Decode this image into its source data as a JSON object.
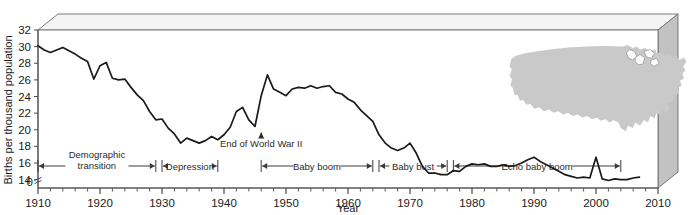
{
  "chart_data": {
    "type": "line",
    "title": "",
    "xlabel": "Year",
    "ylabel": "Births per thousand population",
    "xlim": [
      1910,
      2010
    ],
    "ylim": [
      13,
      32
    ],
    "xticks": [
      1910,
      1920,
      1930,
      1940,
      1950,
      1960,
      1970,
      1980,
      1990,
      2000,
      2010
    ],
    "yticks": [
      14,
      16,
      18,
      20,
      22,
      24,
      26,
      28,
      30,
      32
    ],
    "y_axis_break_label": "0",
    "grid": false,
    "legend": false,
    "minor_tick_interval": 2,
    "series": [
      {
        "name": "US birth rate",
        "x": [
          1910,
          1911,
          1912,
          1913,
          1914,
          1915,
          1916,
          1917,
          1918,
          1919,
          1920,
          1921,
          1922,
          1923,
          1924,
          1925,
          1926,
          1927,
          1928,
          1929,
          1930,
          1931,
          1932,
          1933,
          1934,
          1935,
          1936,
          1937,
          1938,
          1939,
          1940,
          1941,
          1942,
          1943,
          1944,
          1945,
          1946,
          1947,
          1948,
          1949,
          1950,
          1951,
          1952,
          1953,
          1954,
          1955,
          1956,
          1957,
          1958,
          1959,
          1960,
          1961,
          1962,
          1963,
          1964,
          1965,
          1966,
          1967,
          1968,
          1969,
          1970,
          1971,
          1972,
          1973,
          1974,
          1975,
          1976,
          1977,
          1978,
          1979,
          1980,
          1981,
          1982,
          1983,
          1984,
          1985,
          1986,
          1987,
          1988,
          1989,
          1990,
          1991,
          1992,
          1993,
          1994,
          1995,
          1996,
          1997,
          1998,
          1999,
          2000,
          2001,
          2002,
          2003,
          2004,
          2005,
          2006,
          2007
        ],
        "y": [
          30.1,
          29.6,
          29.3,
          29.6,
          29.9,
          29.5,
          29.1,
          28.6,
          28.2,
          26.1,
          27.7,
          28.1,
          26.2,
          26.0,
          26.1,
          25.1,
          24.2,
          23.5,
          22.2,
          21.2,
          21.3,
          20.2,
          19.5,
          18.4,
          19.0,
          18.7,
          18.4,
          18.7,
          19.2,
          18.8,
          19.4,
          20.3,
          22.2,
          22.7,
          21.2,
          20.4,
          24.1,
          26.6,
          24.9,
          24.5,
          24.1,
          24.9,
          25.1,
          25.0,
          25.3,
          25.0,
          25.2,
          25.3,
          24.5,
          24.3,
          23.7,
          23.3,
          22.4,
          21.7,
          21.0,
          19.4,
          18.4,
          17.8,
          17.5,
          17.8,
          18.4,
          17.2,
          15.6,
          14.8,
          14.8,
          14.6,
          14.6,
          15.1,
          15.0,
          15.6,
          15.9,
          15.8,
          15.9,
          15.6,
          15.6,
          15.8,
          15.6,
          15.7,
          16.0,
          16.4,
          16.7,
          16.2,
          15.8,
          15.4,
          15.0,
          14.6,
          14.4,
          14.2,
          14.3,
          14.2,
          16.7,
          14.1,
          13.9,
          14.1,
          14.0,
          14.0,
          14.2,
          14.3
        ]
      }
    ],
    "period_bands": [
      {
        "label": "Demographic transition",
        "start": 1910,
        "end": 1929,
        "two_line": true
      },
      {
        "label": "Depression",
        "start": 1930,
        "end": 1939,
        "two_line": false
      },
      {
        "label": "Baby boom",
        "start": 1946,
        "end": 1964,
        "two_line": false
      },
      {
        "label": "Baby bust",
        "start": 1965,
        "end": 1976,
        "two_line": false
      },
      {
        "label": "Echo baby boom",
        "start": 1977,
        "end": 2004,
        "two_line": false
      }
    ],
    "annotations": [
      {
        "label": "End of World War II",
        "x": 1946,
        "y": 20.4,
        "arrow": "up"
      }
    ],
    "inset": {
      "name": "united-states-map",
      "description": "Gray silhouette map of the contiguous United States",
      "fill_color": "#c9c9c9"
    },
    "colors": {
      "line": "#1a1a1a",
      "frame": "#6e6e6e",
      "panel_top": "#f2f2f2",
      "panel_side": "#bdbdbd",
      "plot_background": "#ffffff",
      "band_arrow": "#3a3a3a"
    }
  }
}
